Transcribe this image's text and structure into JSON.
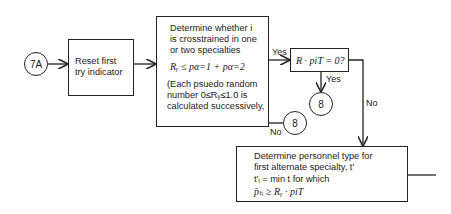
{
  "connectors": {
    "start": "7A",
    "yes_target": "8",
    "no_target": "8"
  },
  "reset_box": {
    "lines": [
      "Reset first",
      "try indicator"
    ]
  },
  "determine_box": {
    "lines": [
      "Determine whether i",
      "is crosstrained in one",
      "or two specialties"
    ],
    "formula": "Rᵧ ≤ pα=1 + pα=2",
    "note_lines": [
      "(Each psuedo random",
      "number 0≤Rᵧ≤1.0 is",
      "calculated successively,"
    ]
  },
  "decision_box": {
    "text": "R · piT = 0?"
  },
  "personnel_box": {
    "lines": [
      "Determine personnel type for",
      "first alternate specialty, t′",
      "t′ᵢ = min  t  for which",
      "p̄ₜᵢ ≥ Rᵧ · piT"
    ]
  },
  "labels": {
    "yes_1": "Yes",
    "yes_2": "Yes",
    "no_1": "No",
    "no_2": "No"
  }
}
